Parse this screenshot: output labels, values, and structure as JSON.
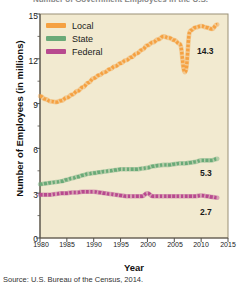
{
  "figure": {
    "title": "Number of Government Employees in the U.S.",
    "source": "Source: U.S. Bureau of the Census, 2014."
  },
  "axes": {
    "xlabel": "Year",
    "ylabel": "Number of Employees (in millions)",
    "xticks": [
      "1980",
      "1985",
      "1990",
      "1995",
      "2000",
      "2005",
      "2010",
      "2015"
    ],
    "yticks": [
      "15",
      "12",
      "9",
      "6",
      "3",
      "0"
    ],
    "xlim": [
      1980,
      2015
    ],
    "ylim": [
      0,
      15
    ],
    "plot_bg": "#f2ead0",
    "frame_color": "#9a9076"
  },
  "legend": {
    "position": "top-left",
    "items": [
      {
        "label": "Local",
        "color": "#f5a142"
      },
      {
        "label": "State",
        "color": "#6aaa78"
      },
      {
        "label": "Federal",
        "color": "#b84a8f"
      }
    ]
  },
  "end_labels": [
    {
      "name": "local-end-label",
      "text": "14.3",
      "color": "#1a1a1a"
    },
    {
      "name": "state-end-label",
      "text": "5.3",
      "color": "#1a1a1a"
    },
    {
      "name": "federal-end-label",
      "text": "2.7",
      "color": "#1a1a1a"
    }
  ],
  "chart_data": {
    "type": "line",
    "title": "Number of Government Employees in the U.S.",
    "xlabel": "Year",
    "ylabel": "Number of Employees (in millions)",
    "xlim": [
      1980,
      2015
    ],
    "ylim": [
      0,
      15
    ],
    "grid": false,
    "legend_position": "top-left",
    "x": [
      1980,
      1981,
      1982,
      1983,
      1984,
      1985,
      1986,
      1987,
      1988,
      1989,
      1990,
      1991,
      1992,
      1993,
      1994,
      1995,
      1996,
      1997,
      1998,
      1999,
      2000,
      2001,
      2002,
      2003,
      2004,
      2005,
      2006,
      2007,
      2008,
      2009,
      2010,
      2011,
      2012,
      2013
    ],
    "series": [
      {
        "name": "Local",
        "color": "#f5a142",
        "end_value": 14.3,
        "values": [
          9.5,
          9.3,
          9.15,
          9.1,
          9.2,
          9.4,
          9.6,
          9.85,
          10.1,
          10.4,
          10.7,
          10.9,
          11.1,
          11.3,
          11.5,
          11.7,
          11.9,
          12.1,
          12.35,
          12.6,
          12.9,
          13.1,
          13.3,
          13.5,
          13.4,
          13.25,
          13.0,
          11.1,
          13.9,
          14.1,
          14.2,
          14.1,
          14.0,
          14.3
        ]
      },
      {
        "name": "State",
        "color": "#6aaa78",
        "end_value": 5.3,
        "values": [
          3.6,
          3.65,
          3.7,
          3.75,
          3.8,
          3.9,
          4.0,
          4.1,
          4.2,
          4.3,
          4.35,
          4.4,
          4.45,
          4.5,
          4.55,
          4.6,
          4.6,
          4.6,
          4.6,
          4.65,
          4.7,
          4.8,
          4.85,
          4.9,
          4.9,
          4.95,
          5.0,
          5.0,
          5.05,
          5.1,
          5.2,
          5.2,
          5.2,
          5.3
        ]
      },
      {
        "name": "Federal",
        "color": "#b84a8f",
        "end_value": 2.7,
        "values": [
          2.9,
          2.9,
          2.9,
          2.95,
          3.0,
          3.0,
          3.05,
          3.05,
          3.1,
          3.1,
          3.1,
          3.05,
          3.0,
          2.95,
          2.9,
          2.85,
          2.8,
          2.8,
          2.8,
          2.8,
          3.0,
          2.8,
          2.8,
          2.8,
          2.8,
          2.8,
          2.8,
          2.8,
          2.8,
          2.8,
          2.85,
          2.8,
          2.75,
          2.7
        ]
      }
    ]
  }
}
